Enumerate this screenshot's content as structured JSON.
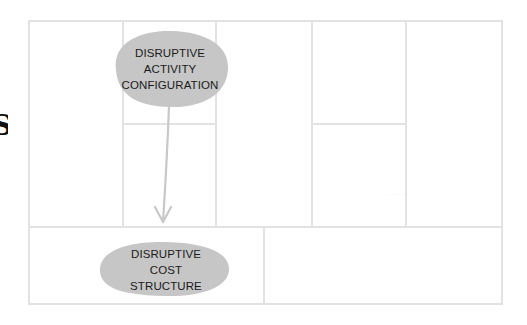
{
  "diagram": {
    "type": "business-model-canvas",
    "edge_glyph": "S",
    "grid": {
      "outer": {
        "x": 28,
        "y": 21,
        "width": 474,
        "height": 283
      },
      "stroke_color": "#e2e2e2",
      "top_row_bottom_y": 227,
      "column_dividers_x": [
        123,
        216,
        312,
        406
      ],
      "split_rows": [
        {
          "column": 2,
          "x1": 123,
          "x2": 216,
          "y": 124
        },
        {
          "column": 4,
          "x1": 312,
          "x2": 406,
          "y": 124
        }
      ],
      "bottom_row_divider_x": 264
    },
    "nodes": [
      {
        "id": "activity",
        "lines": [
          "DISRUPTIVE",
          "ACTIVITY",
          "CONFIGURATION"
        ],
        "fill": "#c6c6c6",
        "cx": 170,
        "cy": 69,
        "rx": 57,
        "ry": 38
      },
      {
        "id": "cost",
        "lines": [
          "DISRUPTIVE",
          "COST",
          "STRUCTURE"
        ],
        "fill": "#c6c6c6",
        "cx": 165,
        "cy": 269,
        "rx": 65,
        "ry": 28
      }
    ],
    "edges": [
      {
        "from": "activity",
        "to": "cost",
        "color": "#c8c8c8"
      }
    ],
    "faint_label": "········ ········"
  }
}
